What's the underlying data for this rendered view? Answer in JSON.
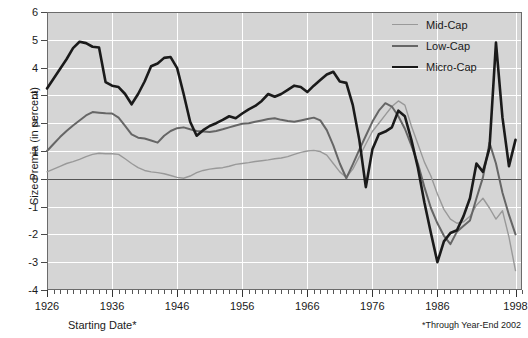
{
  "chart_data": {
    "type": "line",
    "title": "",
    "xlabel": "Starting Date*",
    "ylabel": "Size Premia (in percent)",
    "xlim": [
      1926,
      1999
    ],
    "ylim": [
      -4,
      6
    ],
    "y_ticks": [
      6,
      5,
      4,
      3,
      2,
      1,
      0,
      -1,
      -2,
      -3,
      -4
    ],
    "x_ticks": [
      1926,
      1936,
      1946,
      1956,
      1966,
      1976,
      1986,
      1998
    ],
    "x_minor_tick_step": 1,
    "grid": "horizontal-and-vertical-white",
    "legend_position": "top-right",
    "zero_reference_line": 0,
    "footnote": "*Through Year-End 2002",
    "series": [
      {
        "name": "Mid-Cap",
        "color": "#999999",
        "x": [
          1926,
          1927,
          1928,
          1929,
          1930,
          1931,
          1932,
          1933,
          1934,
          1935,
          1936,
          1937,
          1938,
          1939,
          1940,
          1941,
          1942,
          1943,
          1944,
          1945,
          1946,
          1947,
          1948,
          1949,
          1950,
          1951,
          1952,
          1953,
          1954,
          1955,
          1956,
          1957,
          1958,
          1959,
          1960,
          1961,
          1962,
          1963,
          1964,
          1965,
          1966,
          1967,
          1968,
          1969,
          1970,
          1971,
          1972,
          1973,
          1974,
          1975,
          1976,
          1977,
          1978,
          1979,
          1980,
          1981,
          1982,
          1983,
          1984,
          1985,
          1986,
          1987,
          1988,
          1989,
          1990,
          1991,
          1992,
          1993,
          1994,
          1995,
          1996,
          1997,
          1998
        ],
        "values": [
          0.25,
          0.35,
          0.45,
          0.55,
          0.62,
          0.7,
          0.8,
          0.88,
          0.92,
          0.9,
          0.9,
          0.88,
          0.72,
          0.55,
          0.4,
          0.3,
          0.25,
          0.22,
          0.18,
          0.12,
          0.05,
          0.02,
          0.1,
          0.22,
          0.3,
          0.35,
          0.38,
          0.4,
          0.45,
          0.52,
          0.55,
          0.58,
          0.62,
          0.65,
          0.68,
          0.72,
          0.75,
          0.8,
          0.88,
          0.95,
          1.0,
          1.02,
          0.98,
          0.85,
          0.55,
          0.25,
          0.05,
          0.35,
          0.8,
          1.25,
          1.7,
          2.0,
          2.3,
          2.6,
          2.8,
          2.65,
          1.9,
          1.25,
          0.6,
          0.1,
          -0.55,
          -1.1,
          -1.45,
          -1.6,
          -1.55,
          -1.35,
          -0.95,
          -0.7,
          -1.05,
          -1.45,
          -1.15,
          -2.1,
          -3.3
        ]
      },
      {
        "name": "Low-Cap",
        "color": "#666666",
        "x": [
          1926,
          1927,
          1928,
          1929,
          1930,
          1931,
          1932,
          1933,
          1934,
          1935,
          1936,
          1937,
          1938,
          1939,
          1940,
          1941,
          1942,
          1943,
          1944,
          1945,
          1946,
          1947,
          1948,
          1949,
          1950,
          1951,
          1952,
          1953,
          1954,
          1955,
          1956,
          1957,
          1958,
          1959,
          1960,
          1961,
          1962,
          1963,
          1964,
          1965,
          1966,
          1967,
          1968,
          1969,
          1970,
          1971,
          1972,
          1973,
          1974,
          1975,
          1976,
          1977,
          1978,
          1979,
          1980,
          1981,
          1982,
          1983,
          1984,
          1985,
          1986,
          1987,
          1988,
          1989,
          1990,
          1991,
          1992,
          1993,
          1994,
          1995,
          1996,
          1997,
          1998
        ],
        "values": [
          1.0,
          1.25,
          1.5,
          1.72,
          1.92,
          2.1,
          2.28,
          2.4,
          2.38,
          2.36,
          2.35,
          2.2,
          1.9,
          1.6,
          1.48,
          1.45,
          1.38,
          1.3,
          1.55,
          1.72,
          1.82,
          1.85,
          1.78,
          1.72,
          1.7,
          1.68,
          1.72,
          1.78,
          1.85,
          1.92,
          1.98,
          2.0,
          2.05,
          2.1,
          2.15,
          2.18,
          2.12,
          2.08,
          2.05,
          2.1,
          2.15,
          2.2,
          2.1,
          1.75,
          1.2,
          0.55,
          0.02,
          0.52,
          1.05,
          1.55,
          2.05,
          2.45,
          2.72,
          2.6,
          2.25,
          1.8,
          1.2,
          0.55,
          -0.3,
          -1.05,
          -1.6,
          -2.05,
          -2.35,
          -1.9,
          -1.7,
          -1.5,
          -0.7,
          0.05,
          1.3,
          0.55,
          -0.5,
          -1.3,
          -2.0
        ]
      },
      {
        "name": "Micro-Cap",
        "color": "#1a1a1a",
        "x": [
          1926,
          1927,
          1928,
          1929,
          1930,
          1931,
          1932,
          1933,
          1934,
          1935,
          1936,
          1937,
          1938,
          1939,
          1940,
          1941,
          1942,
          1943,
          1944,
          1945,
          1946,
          1947,
          1948,
          1949,
          1950,
          1951,
          1952,
          1953,
          1954,
          1955,
          1956,
          1957,
          1958,
          1959,
          1960,
          1961,
          1962,
          1963,
          1964,
          1965,
          1966,
          1967,
          1968,
          1969,
          1970,
          1971,
          1972,
          1973,
          1974,
          1975,
          1976,
          1977,
          1978,
          1979,
          1980,
          1981,
          1982,
          1983,
          1984,
          1985,
          1986,
          1987,
          1988,
          1989,
          1990,
          1991,
          1992,
          1993,
          1994,
          1995,
          1996,
          1997,
          1998
        ],
        "values": [
          3.25,
          3.6,
          3.95,
          4.3,
          4.7,
          4.93,
          4.88,
          4.75,
          4.72,
          3.48,
          3.35,
          3.3,
          3.05,
          2.68,
          3.05,
          3.5,
          4.05,
          4.15,
          4.35,
          4.38,
          3.98,
          3.05,
          2.05,
          1.55,
          1.75,
          1.9,
          2.0,
          2.12,
          2.25,
          2.18,
          2.35,
          2.5,
          2.62,
          2.8,
          3.05,
          2.95,
          3.05,
          3.2,
          3.35,
          3.3,
          3.12,
          3.35,
          3.55,
          3.75,
          3.85,
          3.5,
          3.45,
          2.65,
          1.4,
          -0.3,
          1.05,
          1.6,
          1.7,
          1.85,
          2.45,
          2.25,
          1.4,
          0.4,
          -0.85,
          -1.95,
          -3.0,
          -2.25,
          -1.95,
          -1.85,
          -1.35,
          -0.7,
          0.55,
          0.25,
          1.1,
          4.9,
          2.2,
          0.45,
          1.4
        ]
      }
    ]
  },
  "axes": {
    "ylabel": "Size Premia (in percent)",
    "xlabel": "Starting Date*",
    "ytick_labels": [
      "6",
      "5",
      "4",
      "3",
      "2",
      "1",
      "0",
      "-1",
      "-2",
      "-3",
      "-4"
    ],
    "xtick_labels": [
      "1926",
      "1936",
      "1946",
      "1956",
      "1966",
      "1976",
      "1986",
      "1998"
    ]
  },
  "legend": {
    "items": [
      {
        "label": "Mid-Cap",
        "color": "#999999",
        "width": "1.4px"
      },
      {
        "label": "Low-Cap",
        "color": "#666666",
        "width": "2px"
      },
      {
        "label": "Micro-Cap",
        "color": "#1a1a1a",
        "width": "2.6px"
      }
    ]
  },
  "footnotes": {
    "left": "Starting Date*",
    "right": "*Through Year-End 2002"
  },
  "colors": {
    "plot_background": "#d5d5d5",
    "grid": "#ffffff",
    "frame": "#6b6b6b",
    "zero_line": "#555555",
    "page_background": "#ffffff"
  }
}
